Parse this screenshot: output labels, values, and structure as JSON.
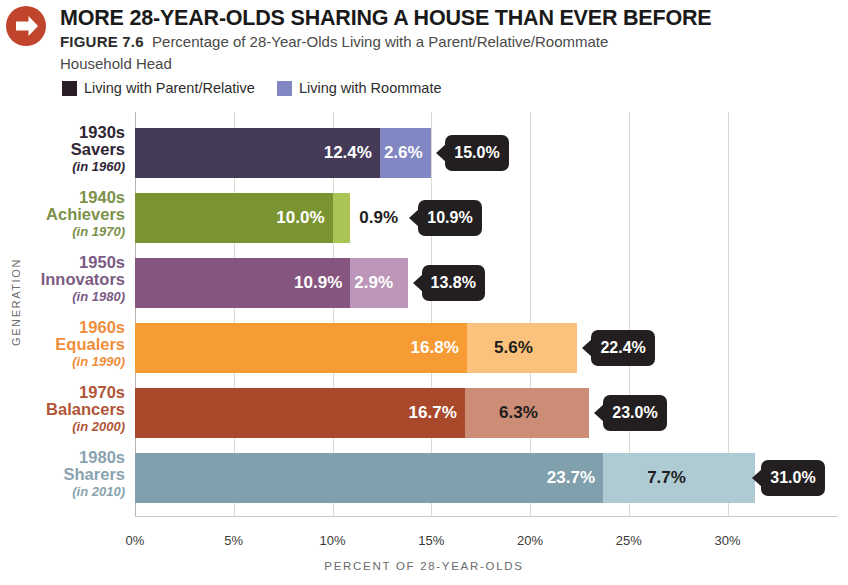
{
  "header": {
    "icon": "red-circle-right-arrow-icon",
    "title": "MORE 28-YEAR-OLDS SHARING A HOUSE THAN EVER BEFORE",
    "figure_number": "FIGURE 7.6",
    "caption_line1": "Percentage of 28-Year-Olds Living with a Parent/Relative/Roommate",
    "caption_line2": "Household Head",
    "accent_color": "#c0452c"
  },
  "legend": {
    "position": "top-left",
    "items": [
      {
        "label": "Living with Parent/Relative",
        "color": "#2b1d26"
      },
      {
        "label": "Living with Roommate",
        "color": "#8187c2"
      }
    ]
  },
  "chart_data": {
    "type": "bar",
    "orientation": "horizontal",
    "stacked": true,
    "title": "MORE 28-YEAR-OLDS SHARING A HOUSE THAN EVER BEFORE",
    "subtitle": "Percentage of 28-Year-Olds Living with a Parent/Relative/Roommate Household Head",
    "xlabel": "PERCENT OF 28-YEAR-OLDS",
    "ylabel": "GENERATION",
    "xlim": [
      0,
      31.8
    ],
    "xticks": [
      0,
      5,
      10,
      15,
      20,
      25,
      30
    ],
    "xticklabels": [
      "0%",
      "5%",
      "10%",
      "15%",
      "20%",
      "25%",
      "30%"
    ],
    "grid": "vertical",
    "categories": [
      "1930s Savers (in 1960)",
      "1940s Achievers (in 1970)",
      "1950s Innovators (in 1980)",
      "1960s Equalers (in 1990)",
      "1970s Balancers (in 2000)",
      "1980s Sharers (in 2010)"
    ],
    "series": [
      {
        "name": "Living with Parent/Relative",
        "values": [
          12.4,
          10.0,
          10.9,
          16.8,
          16.7,
          23.7
        ]
      },
      {
        "name": "Living with Roommate",
        "values": [
          2.6,
          0.9,
          2.9,
          5.6,
          6.3,
          7.7
        ]
      }
    ],
    "totals": [
      15.0,
      10.9,
      13.8,
      22.4,
      23.0,
      31.0
    ]
  },
  "rows": [
    {
      "gen_line1": "1930s",
      "gen_line2": "Savers",
      "gen_line3": "(in 1960)",
      "label_color": "#2f2533",
      "v1": "12.4%",
      "v2": "2.6%",
      "total": "15.0%",
      "v1_num": 12.4,
      "v2_num": 2.6,
      "total_num": 15.0,
      "c1": "#453b59",
      "c2": "#8187c2",
      "v2_style": "inside"
    },
    {
      "gen_line1": "1940s",
      "gen_line2": "Achievers",
      "gen_line3": "(in 1970)",
      "label_color": "#7d914a",
      "v1": "10.0%",
      "v2": "0.9%",
      "total": "10.9%",
      "v1_num": 10.0,
      "v2_num": 0.9,
      "total_num": 10.9,
      "c1": "#7b9432",
      "c2": "#aac455",
      "v2_style": "outside"
    },
    {
      "gen_line1": "1950s",
      "gen_line2": "Innovators",
      "gen_line3": "(in 1980)",
      "label_color": "#7c5b84",
      "v1": "10.9%",
      "v2": "2.9%",
      "total": "13.8%",
      "v1_num": 10.9,
      "v2_num": 2.9,
      "total_num": 13.8,
      "c1": "#86557f",
      "c2": "#bb96b8",
      "v2_style": "inside"
    },
    {
      "gen_line1": "1960s",
      "gen_line2": "Equalers",
      "gen_line3": "(in 1990)",
      "label_color": "#ef8e3c",
      "v1": "16.8%",
      "v2": "5.6%",
      "total": "22.4%",
      "v1_num": 16.8,
      "v2_num": 5.6,
      "total_num": 22.4,
      "c1": "#f79b35",
      "c2": "#fac27c",
      "v2_style": "dark"
    },
    {
      "gen_line1": "1970s",
      "gen_line2": "Balancers",
      "gen_line3": "(in 2000)",
      "label_color": "#b1563a",
      "v1": "16.7%",
      "v2": "6.3%",
      "total": "23.0%",
      "v1_num": 16.7,
      "v2_num": 6.3,
      "total_num": 23.0,
      "c1": "#a9492c",
      "c2": "#cc8d76",
      "v2_style": "dark"
    },
    {
      "gen_line1": "1980s",
      "gen_line2": "Sharers",
      "gen_line3": "(in 2010)",
      "label_color": "#8aa3b0",
      "v1": "23.7%",
      "v2": "7.7%",
      "total": "31.0%",
      "v1_num": 23.7,
      "v2_num": 7.7,
      "total_num": 31.0,
      "c1": "#7fa0ac",
      "c2": "#aecbd3",
      "v2_style": "dark"
    }
  ],
  "axis": {
    "y_title": "GENERATION",
    "x_title": "PERCENT OF 28-YEAR-OLDS",
    "xticklabels": [
      "0%",
      "5%",
      "10%",
      "15%",
      "20%",
      "25%",
      "30%"
    ]
  }
}
